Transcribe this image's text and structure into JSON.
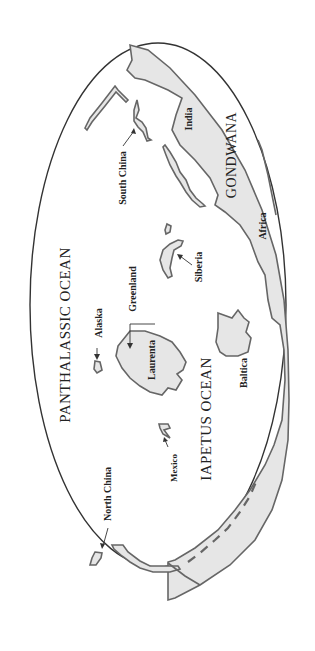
{
  "map": {
    "type": "paleogeographic world map (rotated 90°)",
    "oceans": [
      {
        "id": "panthalassic",
        "label": "PANTHALASSIC OCEAN"
      },
      {
        "id": "iapetus",
        "label": "IAPETUS OCEAN"
      }
    ],
    "supercontinent": {
      "label": "GONDWANA"
    },
    "landmasses": [
      {
        "id": "india",
        "label": "India"
      },
      {
        "id": "africa",
        "label": "Africa"
      },
      {
        "id": "south-china",
        "label": "South China"
      },
      {
        "id": "siberia",
        "label": "Siberia"
      },
      {
        "id": "greenland",
        "label": "Greenland"
      },
      {
        "id": "alaska",
        "label": "Alaska"
      },
      {
        "id": "laurentia",
        "label": "Laurenta"
      },
      {
        "id": "baltica",
        "label": "Baltica"
      },
      {
        "id": "mexico",
        "label": "Mexico"
      },
      {
        "id": "north-china",
        "label": "North China"
      }
    ],
    "colors": {
      "land": "#e6e6e6",
      "coast": "#666666",
      "outline": "#333333",
      "background": "#ffffff"
    }
  }
}
